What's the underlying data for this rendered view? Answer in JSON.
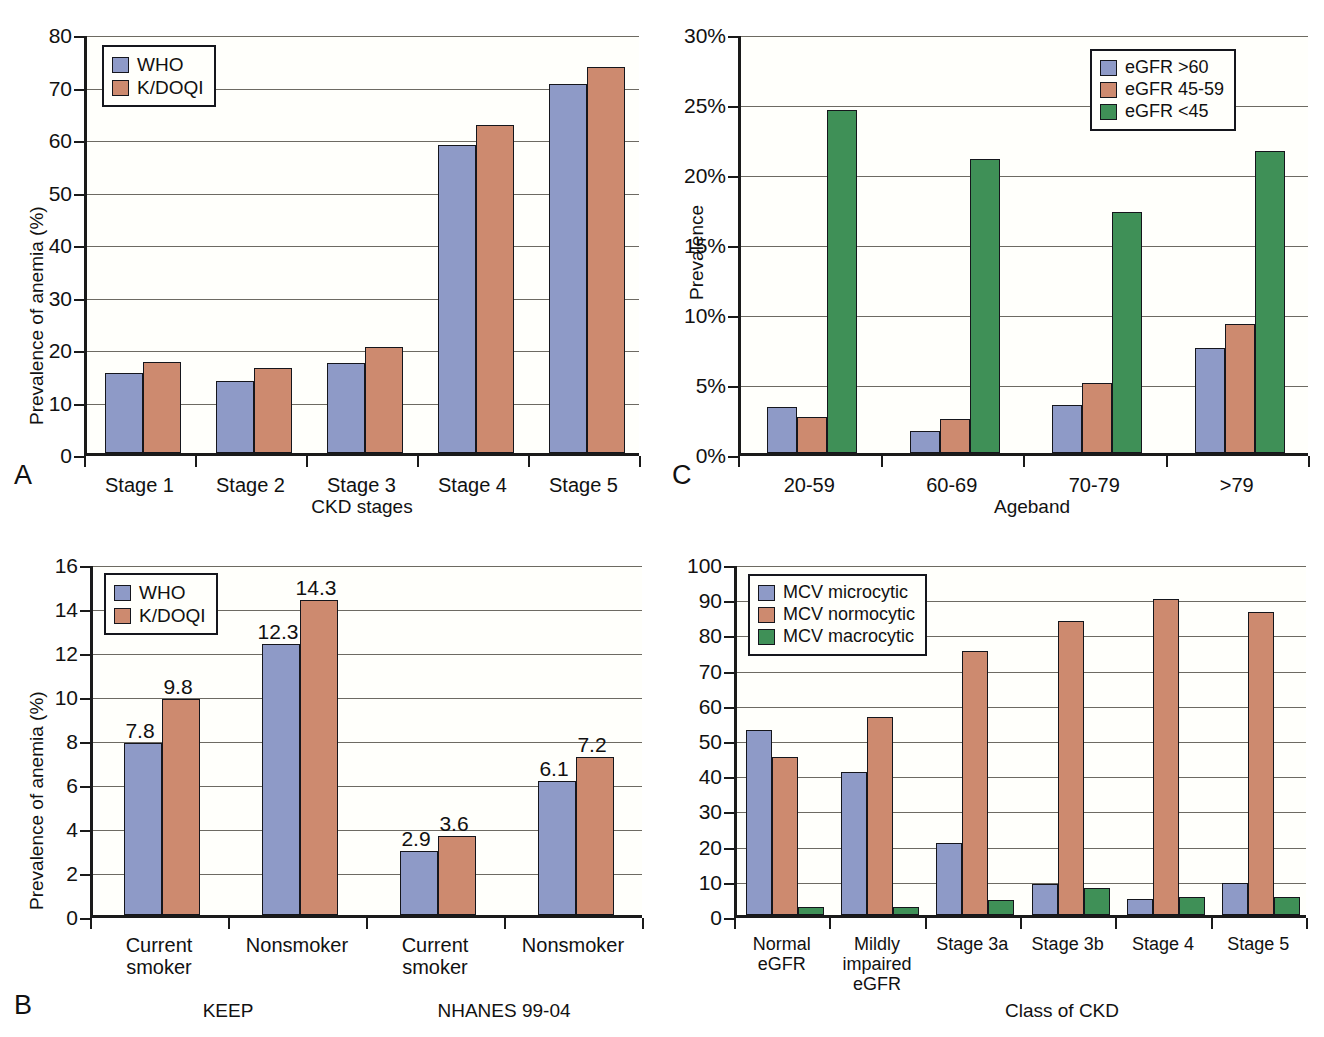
{
  "figure": {
    "panels": [
      "A",
      "B",
      "C",
      "D"
    ],
    "colors": {
      "blue": "#8e9ac7",
      "red": "#cd8a6f",
      "green": "#3f9057",
      "axis": "#15161c",
      "grid": "#6d6a62"
    }
  },
  "panelA": {
    "letter": "A",
    "chart_data": {
      "type": "bar",
      "title": "",
      "xlabel": "CKD stages",
      "ylabel": "Prevalence of anemia (%)",
      "categories": [
        "Stage 1",
        "Stage 2",
        "Stage 3",
        "Stage 4",
        "Stage 5"
      ],
      "series": [
        {
          "name": "WHO",
          "color": "#8e9ac7",
          "values": [
            15.2,
            13.8,
            17.1,
            58.7,
            70.2
          ]
        },
        {
          "name": "K/DOQI",
          "color": "#cd8a6f",
          "values": [
            17.4,
            16.2,
            20.1,
            62.4,
            73.6
          ]
        }
      ],
      "ylim": [
        0,
        80
      ],
      "yticks": [
        "0",
        "10",
        "20",
        "30",
        "40",
        "50",
        "60",
        "70",
        "80"
      ],
      "grid": true,
      "legend_position": "top-left"
    }
  },
  "panelB": {
    "letter": "B",
    "group_labels": [
      "KEEP",
      "NHANES 99-04"
    ],
    "chart_data": {
      "type": "bar",
      "title": "",
      "xlabel": "",
      "ylabel": "Prevalence of anemia (%)",
      "categories": [
        "Current\nsmoker",
        "Nonsmoker",
        "Current\nsmoker",
        "Nonsmoker"
      ],
      "series": [
        {
          "name": "WHO",
          "color": "#8e9ac7",
          "values": [
            7.8,
            12.3,
            2.9,
            6.1
          ]
        },
        {
          "name": "K/DOQI",
          "color": "#cd8a6f",
          "values": [
            9.8,
            14.3,
            3.6,
            7.2
          ]
        }
      ],
      "data_labels": [
        [
          "7.8",
          "12.3",
          "2.9",
          "6.1"
        ],
        [
          "9.8",
          "14.3",
          "3.6",
          "7.2"
        ]
      ],
      "ylim": [
        0,
        16
      ],
      "yticks": [
        "0",
        "2",
        "4",
        "6",
        "8",
        "10",
        "12",
        "14",
        "16"
      ],
      "grid": true,
      "legend_position": "top-left"
    }
  },
  "panelC": {
    "letter": "C",
    "chart_data": {
      "type": "bar",
      "title": "",
      "xlabel": "Ageband",
      "ylabel": "Prevalence",
      "categories": [
        "20-59",
        "60-69",
        "70-79",
        ">79"
      ],
      "series": [
        {
          "name": "eGFR >60",
          "color": "#8e9ac7",
          "values": [
            3.3,
            1.6,
            3.4,
            7.5
          ]
        },
        {
          "name": "eGFR 45-59",
          "color": "#cd8a6f",
          "values": [
            2.6,
            2.4,
            5.0,
            9.2
          ]
        },
        {
          "name": "eGFR <45",
          "color": "#3f9057",
          "values": [
            24.5,
            21.0,
            17.2,
            21.6
          ]
        }
      ],
      "ylim": [
        0,
        30
      ],
      "yticks": [
        "0%",
        "5%",
        "10%",
        "15%",
        "20%",
        "25%",
        "30%"
      ],
      "grid": true,
      "legend_position": "top-right"
    }
  },
  "panelD": {
    "letter": "D",
    "chart_data": {
      "type": "bar",
      "title": "",
      "xlabel": "Class of CKD",
      "ylabel": "",
      "categories": [
        "Normal\neGFR",
        "Mildly\nimpaired\neGFR",
        "Stage 3a",
        "Stage 3b",
        "Stage 4",
        "Stage 5"
      ],
      "series": [
        {
          "name": "MCV microcytic",
          "color": "#8e9ac7",
          "values": [
            52.5,
            40.7,
            20.4,
            8.8,
            4.6,
            9.2
          ]
        },
        {
          "name": "MCV normocytic",
          "color": "#cd8a6f",
          "values": [
            45.0,
            56.3,
            75.1,
            83.4,
            89.9,
            86.2
          ]
        },
        {
          "name": "MCV macrocytic",
          "color": "#3f9057",
          "values": [
            2.4,
            2.4,
            4.4,
            7.6,
            5.2,
            5.0
          ]
        }
      ],
      "ylim": [
        0,
        100
      ],
      "yticks": [
        "0",
        "10",
        "20",
        "30",
        "40",
        "50",
        "60",
        "70",
        "80",
        "90",
        "100"
      ],
      "grid": true,
      "legend_position": "top-left"
    }
  }
}
